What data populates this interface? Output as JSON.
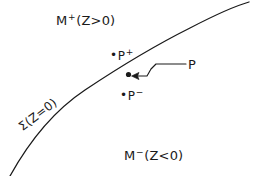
{
  "figure": {
    "kind": "hypersurface-partition-diagram",
    "background_color": "#ffffff",
    "stroke_color": "#1a1a1a",
    "width": 260,
    "height": 176
  },
  "labels": {
    "region_upper": {
      "base": "M",
      "superscript": "+",
      "condition": "(Z>0)",
      "full": "M+(Z>0)"
    },
    "region_lower": {
      "base": "M",
      "superscript": "−",
      "condition": "(Z<0)",
      "full": "M−(Z<0)"
    },
    "surface": {
      "base": "Σ",
      "condition": "(Z=0)",
      "full": "Σ(Z=0)",
      "rotation_deg": -37
    },
    "point_on_surface": {
      "text": "P"
    },
    "point_above": {
      "bullet": "•",
      "base": "P",
      "superscript": "+",
      "full": "•P+"
    },
    "point_below": {
      "bullet": "•",
      "base": "P",
      "superscript": "−",
      "full": "•P−"
    }
  },
  "geometry": {
    "surface_curve_path": "M 10 176 C 30 140 55 110 85 90 C 115 70 150 48 190 28 C 215 15 235 6 249 2",
    "marker_point": {
      "x": 128.5,
      "y": 74.5,
      "radius": 2.6
    },
    "annotation_arrow_path": "M 186 64 L 163 64 L 156 64 L 151 69 L 147 76 L 140 76 L 136 76",
    "arrowhead_tip": {
      "x": 132,
      "y": 76
    }
  }
}
